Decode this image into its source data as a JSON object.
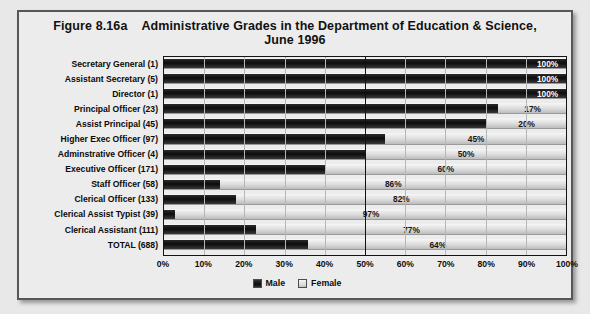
{
  "figure": {
    "number": "Figure 8.16a",
    "title_line1": "Administrative Grades in the Department of Education & Science,",
    "title_line2": "June 1996"
  },
  "legend": {
    "position": "bottom-center",
    "items": [
      {
        "label": "Male",
        "color": "#111111",
        "swatch": "male"
      },
      {
        "label": "Female",
        "color": "#dedede",
        "swatch": "female"
      }
    ]
  },
  "chart_data": {
    "type": "bar",
    "orientation": "horizontal",
    "stacked": true,
    "stack_total": 100,
    "xlabel": "",
    "ylabel": "",
    "xlim": [
      0,
      100
    ],
    "xunit": "%",
    "grid": true,
    "legend_position": "bottom-center",
    "tick_labels": [
      "0%",
      "10%",
      "20%",
      "30%",
      "40%",
      "50%",
      "60%",
      "70%",
      "80%",
      "90%",
      "100%"
    ],
    "tick_values": [
      0,
      10,
      20,
      30,
      40,
      50,
      60,
      70,
      80,
      90,
      100
    ],
    "categories": [
      "Secretary General (1)",
      "Assistant Secretary (5)",
      "Director (1)",
      "Principal Officer (23)",
      "Assist Principal (45)",
      "Higher Exec Officer (97)",
      "Adminstrative Officer (4)",
      "Executive Officer (171)",
      "Staff Officer (58)",
      "Clerical Officer (133)",
      "Clerical Assist Typist (39)",
      "Clerical Assistant (111)",
      "TOTAL (688)"
    ],
    "series": [
      {
        "name": "Male",
        "values": [
          100,
          100,
          100,
          83,
          80,
          55,
          50,
          40,
          14,
          18,
          3,
          23,
          36
        ]
      },
      {
        "name": "Female",
        "values": [
          0,
          0,
          0,
          17,
          20,
          45,
          50,
          60,
          86,
          82,
          97,
          77,
          64
        ]
      }
    ],
    "data_labels": [
      "100%",
      "100%",
      "100%",
      "17%",
      "20%",
      "45%",
      "50%",
      "60%",
      "86%",
      "82%",
      "97%",
      "77%",
      "64%"
    ],
    "label_placement": [
      "male",
      "male",
      "male",
      "female",
      "female",
      "female",
      "female",
      "female",
      "female",
      "female",
      "female",
      "female",
      "female"
    ]
  },
  "rows": [
    {
      "label": "Secretary General (1)",
      "male": 100,
      "female": 0,
      "value": "100%",
      "on": "male"
    },
    {
      "label": "Assistant Secretary (5)",
      "male": 100,
      "female": 0,
      "value": "100%",
      "on": "male"
    },
    {
      "label": "Director (1)",
      "male": 100,
      "female": 0,
      "value": "100%",
      "on": "male"
    },
    {
      "label": "Principal Officer (23)",
      "male": 83,
      "female": 17,
      "value": "17%",
      "on": "female"
    },
    {
      "label": "Assist Principal (45)",
      "male": 80,
      "female": 20,
      "value": "20%",
      "on": "female"
    },
    {
      "label": "Higher Exec Officer (97)",
      "male": 55,
      "female": 45,
      "value": "45%",
      "on": "female"
    },
    {
      "label": "Adminstrative Officer (4)",
      "male": 50,
      "female": 50,
      "value": "50%",
      "on": "female"
    },
    {
      "label": "Executive Officer (171)",
      "male": 40,
      "female": 60,
      "value": "60%",
      "on": "female"
    },
    {
      "label": "Staff Officer (58)",
      "male": 14,
      "female": 86,
      "value": "86%",
      "on": "female"
    },
    {
      "label": "Clerical Officer (133)",
      "male": 18,
      "female": 82,
      "value": "82%",
      "on": "female"
    },
    {
      "label": "Clerical Assist Typist (39)",
      "male": 3,
      "female": 97,
      "value": "97%",
      "on": "female"
    },
    {
      "label": "Clerical Assistant (111)",
      "male": 23,
      "female": 77,
      "value": "77%",
      "on": "female"
    },
    {
      "label": "TOTAL (688)",
      "male": 36,
      "female": 64,
      "value": "64%",
      "on": "female"
    }
  ]
}
